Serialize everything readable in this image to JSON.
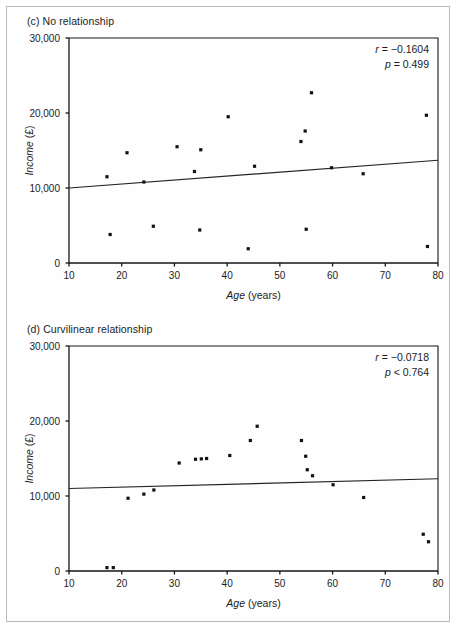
{
  "figure": {
    "background": "#ffffff",
    "border_color": "#b9b9bd",
    "point_color": "#121214",
    "line_color": "#222327"
  },
  "panels": [
    {
      "id": "c",
      "title": "(c) No relationship",
      "stats": {
        "r_label": "r",
        "r_eq": " = ",
        "r_value": "−0.1604",
        "p_label": "p",
        "p_eq": " = ",
        "p_value": "0.499"
      },
      "chart_data": {
        "type": "scatter",
        "title": "(c) No relationship",
        "xlabel": "Age (years)",
        "ylabel": "Income (£)",
        "xlim": [
          10,
          80
        ],
        "ylim": [
          0,
          30000
        ],
        "xticks": [
          10,
          20,
          30,
          40,
          50,
          60,
          70,
          80
        ],
        "xticklabels": [
          "10",
          "20",
          "30",
          "40",
          "50",
          "60",
          "70",
          "80"
        ],
        "yticks": [
          0,
          10000,
          20000,
          30000
        ],
        "yticklabels": [
          "0",
          "10,000",
          "20,000",
          "30,000"
        ],
        "grid": false,
        "legend": null,
        "annotations": [
          "r = −0.1604",
          "p = 0.499"
        ],
        "points": [
          {
            "x": 17.2,
            "y": 11500
          },
          {
            "x": 17.8,
            "y": 3800
          },
          {
            "x": 21.0,
            "y": 14700
          },
          {
            "x": 24.2,
            "y": 10800
          },
          {
            "x": 26.0,
            "y": 4900
          },
          {
            "x": 30.5,
            "y": 15500
          },
          {
            "x": 33.8,
            "y": 12200
          },
          {
            "x": 35.0,
            "y": 15100
          },
          {
            "x": 34.8,
            "y": 4400
          },
          {
            "x": 40.2,
            "y": 19500
          },
          {
            "x": 44.0,
            "y": 1900
          },
          {
            "x": 45.2,
            "y": 12900
          },
          {
            "x": 54.0,
            "y": 16200
          },
          {
            "x": 54.8,
            "y": 17600
          },
          {
            "x": 55.0,
            "y": 4500
          },
          {
            "x": 56.0,
            "y": 22700
          },
          {
            "x": 59.8,
            "y": 12700
          },
          {
            "x": 65.8,
            "y": 11900
          },
          {
            "x": 77.8,
            "y": 19700
          },
          {
            "x": 78.0,
            "y": 2200
          }
        ],
        "trend_line": {
          "x_start": 10,
          "y_start": 10000,
          "x_end": 80,
          "y_end": 13700
        }
      }
    },
    {
      "id": "d",
      "title": "(d) Curvilinear relationship",
      "stats": {
        "r_label": "r",
        "r_eq": " = ",
        "r_value": "−0.0718",
        "p_label": "p",
        "p_eq": " < ",
        "p_value": "0.764"
      },
      "chart_data": {
        "type": "scatter",
        "title": "(d) Curvilinear relationship",
        "xlabel": "Age (years)",
        "ylabel": "Income (£)",
        "xlim": [
          10,
          80
        ],
        "ylim": [
          0,
          30000
        ],
        "xticks": [
          10,
          20,
          30,
          40,
          50,
          60,
          70,
          80
        ],
        "xticklabels": [
          "10",
          "20",
          "30",
          "40",
          "50",
          "60",
          "70",
          "80"
        ],
        "yticks": [
          0,
          10000,
          20000,
          30000
        ],
        "yticklabels": [
          "0",
          "10,000",
          "20,000",
          "30,000"
        ],
        "grid": false,
        "legend": null,
        "annotations": [
          "r = −0.0718",
          "p < 0.764"
        ],
        "points": [
          {
            "x": 17.2,
            "y": 450
          },
          {
            "x": 18.4,
            "y": 450
          },
          {
            "x": 21.2,
            "y": 9700
          },
          {
            "x": 24.2,
            "y": 10250
          },
          {
            "x": 26.1,
            "y": 10800
          },
          {
            "x": 30.9,
            "y": 14400
          },
          {
            "x": 34.0,
            "y": 14900
          },
          {
            "x": 35.1,
            "y": 14950
          },
          {
            "x": 36.1,
            "y": 15000
          },
          {
            "x": 40.5,
            "y": 15400
          },
          {
            "x": 44.4,
            "y": 17400
          },
          {
            "x": 45.7,
            "y": 19300
          },
          {
            "x": 54.1,
            "y": 17400
          },
          {
            "x": 54.9,
            "y": 15300
          },
          {
            "x": 55.2,
            "y": 13500
          },
          {
            "x": 56.2,
            "y": 12700
          },
          {
            "x": 60.1,
            "y": 11500
          },
          {
            "x": 65.9,
            "y": 9800
          },
          {
            "x": 77.2,
            "y": 4900
          },
          {
            "x": 78.2,
            "y": 3900
          }
        ],
        "trend_line": {
          "x_start": 10,
          "y_start": 11000,
          "x_end": 80,
          "y_end": 12300
        }
      }
    }
  ]
}
